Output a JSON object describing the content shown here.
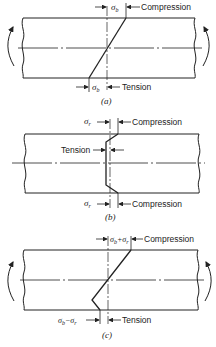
{
  "figure": {
    "panels": [
      {
        "id": "a",
        "caption": "(a)",
        "top_dimension": {
          "symbol": "σ",
          "subscript": "b",
          "label": "Compression"
        },
        "bottom_dimension": {
          "symbol": "σ",
          "subscript": "b",
          "label": "Tension"
        },
        "moment_arrows": true,
        "stress_profile": "linear"
      },
      {
        "id": "b",
        "caption": "(b)",
        "top_dimension": {
          "symbol": "σ",
          "subscript": "r",
          "label": "Compression"
        },
        "middle_dimension": {
          "label": "Tension"
        },
        "bottom_dimension": {
          "symbol": "σ",
          "subscript": "r",
          "label": "Compression"
        },
        "moment_arrows": false,
        "stress_profile": "residual"
      },
      {
        "id": "c",
        "caption": "(c)",
        "top_dimension": {
          "expression_a": "σ",
          "sub_a": "b",
          "op": "+",
          "expression_b": "σ",
          "sub_b": "r",
          "label": "Compression"
        },
        "bottom_dimension": {
          "expression_a": "σ",
          "sub_a": "b",
          "op": "−",
          "expression_b": "σ",
          "sub_b": "r",
          "label": "Tension"
        },
        "moment_arrows": true,
        "stress_profile": "combined"
      }
    ],
    "colors": {
      "line": "#222222",
      "background": "#ffffff"
    }
  }
}
